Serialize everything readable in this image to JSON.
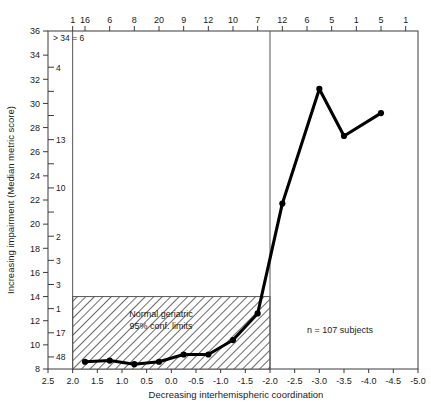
{
  "chart_data": {
    "type": "line",
    "title": "",
    "xlabel": "Decreasing interhemispheric coordination",
    "ylabel": "Increasing impairment (Median metric score)",
    "xlim": [
      2.5,
      -5.0
    ],
    "ylim": [
      8,
      36
    ],
    "grid": false,
    "legend": null,
    "x": [
      1.75,
      1.25,
      0.75,
      0.25,
      -0.25,
      -0.75,
      -1.25,
      -1.75,
      -2.25,
      -3.0,
      -3.5,
      -4.25
    ],
    "y": [
      8.6,
      8.7,
      8.4,
      8.6,
      9.2,
      9.2,
      10.4,
      12.6,
      21.7,
      31.2,
      27.3,
      29.2
    ],
    "series": [
      {
        "name": "Median metric score",
        "values": [
          8.6,
          8.7,
          8.4,
          8.6,
          9.2,
          9.2,
          10.4,
          12.6,
          21.7,
          31.2,
          27.3,
          29.2
        ]
      }
    ],
    "x_tick_labels": [
      "2.5",
      "2.0",
      "1.5",
      "1.0",
      "0.5",
      "0.0",
      "-0.5",
      "-1.0",
      "-1.5",
      "-2.0",
      "-2.5",
      "-3.0",
      "-3.5",
      "-4.0",
      "-4.5",
      "-5.0"
    ],
    "x_tick_values": [
      2.5,
      2.0,
      1.5,
      1.0,
      0.5,
      0.0,
      -0.5,
      -1.0,
      -1.5,
      -2.0,
      -2.5,
      -3.0,
      -3.5,
      -4.0,
      -4.5,
      -5.0
    ],
    "y_tick_labels": [
      "8",
      "10",
      "12",
      "14",
      "16",
      "18",
      "20",
      "22",
      "24",
      "26",
      "28",
      "30",
      "32",
      "34",
      "36"
    ],
    "y_tick_values": [
      8,
      10,
      12,
      14,
      16,
      18,
      20,
      22,
      24,
      26,
      28,
      30,
      32,
      34,
      36
    ],
    "top_axis_counts": [
      {
        "x": 2.0,
        "label": "1"
      },
      {
        "x": 1.75,
        "label": "16"
      },
      {
        "x": 1.25,
        "label": "6"
      },
      {
        "x": 0.75,
        "label": "8"
      },
      {
        "x": 0.25,
        "label": "20"
      },
      {
        "x": -0.25,
        "label": "9"
      },
      {
        "x": -0.75,
        "label": "12"
      },
      {
        "x": -1.25,
        "label": "10"
      },
      {
        "x": -1.75,
        "label": "7"
      },
      {
        "x": -2.25,
        "label": "12"
      },
      {
        "x": -2.75,
        "label": "6"
      },
      {
        "x": -3.25,
        "label": "5"
      },
      {
        "x": -3.75,
        "label": "1"
      },
      {
        "x": -4.25,
        "label": "5"
      },
      {
        "x": -4.75,
        "label": "1"
      }
    ],
    "left_axis_counts": [
      {
        "y": 33,
        "label": "4"
      },
      {
        "y": 31,
        "label": ""
      },
      {
        "y": 29,
        "label": ""
      },
      {
        "y": 27,
        "label": "13"
      },
      {
        "y": 25,
        "label": ""
      },
      {
        "y": 23,
        "label": "10"
      },
      {
        "y": 21,
        "label": ""
      },
      {
        "y": 19,
        "label": "2"
      },
      {
        "y": 17,
        "label": "3"
      },
      {
        "y": 15,
        "label": "3"
      },
      {
        "y": 13,
        "label": "1"
      },
      {
        "y": 11,
        "label": "17"
      },
      {
        "y": 9,
        "label": "48"
      }
    ],
    "annotations": {
      "overflow_note": "> 34 = 6",
      "ci_box_line1": "Normal geriatric",
      "ci_box_line2": "95% conf. limits",
      "sample_size": "n = 107 subjects"
    },
    "ci_box": {
      "x_start": 2.0,
      "x_end": -2.0,
      "y_start": 8,
      "y_end": 14
    },
    "divider_x_values": [
      2.0,
      -2.0
    ],
    "colors": {
      "series": "#000000",
      "frame": "#3a3a3a",
      "hatch": "#555555",
      "background": "#ffffff"
    }
  }
}
